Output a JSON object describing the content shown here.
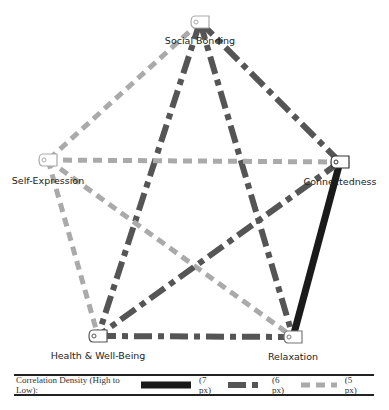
{
  "diagram": {
    "nodes": [
      {
        "id": "social",
        "label": "Social Bonding",
        "x": 200,
        "y": 22,
        "label_y": 44,
        "border": "#aaaaaa"
      },
      {
        "id": "self",
        "label": "Self-Expression",
        "x": 48,
        "y": 160,
        "label_y": 184,
        "border": "#aaaaaa"
      },
      {
        "id": "connect",
        "label": "Connectedness",
        "x": 340,
        "y": 162,
        "label_y": 185,
        "border": "#333333"
      },
      {
        "id": "health",
        "label": "Health & Well-Being",
        "x": 98,
        "y": 336,
        "label_y": 359,
        "border": "#555555"
      },
      {
        "id": "relax",
        "label": "Relaxation",
        "x": 293,
        "y": 337,
        "label_y": 360,
        "border": "#777777"
      }
    ],
    "edges": [
      {
        "from": "social",
        "to": "self",
        "style": "low"
      },
      {
        "from": "social",
        "to": "health",
        "style": "mid"
      },
      {
        "from": "social",
        "to": "relax",
        "style": "mid"
      },
      {
        "from": "social",
        "to": "connect",
        "style": "mid"
      },
      {
        "from": "self",
        "to": "connect",
        "style": "low"
      },
      {
        "from": "self",
        "to": "health",
        "style": "low"
      },
      {
        "from": "self",
        "to": "relax",
        "style": "low"
      },
      {
        "from": "connect",
        "to": "relax",
        "style": "high"
      },
      {
        "from": "connect",
        "to": "health",
        "style": "mid"
      },
      {
        "from": "health",
        "to": "relax",
        "style": "mid"
      }
    ],
    "styles": {
      "high": {
        "color": "#1a1a1a",
        "width": 7,
        "dash": ""
      },
      "mid": {
        "color": "#555555",
        "width": 6,
        "dash": "18 6 6 6"
      },
      "low": {
        "color": "#aaaaaa",
        "width": 5,
        "dash": "9 6"
      }
    }
  },
  "legend": {
    "title": "Correlation Density (High to Low):",
    "items": [
      {
        "style": "high",
        "label": "(7  px)"
      },
      {
        "style": "mid",
        "label": "(6 px)"
      },
      {
        "style": "low",
        "label": "(5 px)"
      }
    ]
  }
}
